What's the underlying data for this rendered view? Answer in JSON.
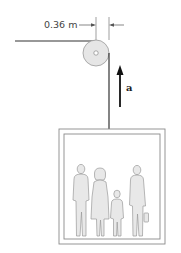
{
  "diagram": {
    "type": "physics-figure",
    "labels": {
      "pulley_radius": "0.36 m",
      "acceleration": "a"
    },
    "components": [
      {
        "name": "support-cable",
        "desc": "horizontal cable leading to pulley"
      },
      {
        "name": "pulley",
        "desc": "disk with center axle",
        "radius_label": "0.36 m"
      },
      {
        "name": "elevator-cable",
        "desc": "vertical cable from pulley to elevator"
      },
      {
        "name": "acceleration-arrow",
        "direction": "up",
        "label": "a"
      },
      {
        "name": "elevator-cab",
        "desc": "box containing four passengers"
      }
    ],
    "passengers": [
      "man",
      "woman",
      "child",
      "person-with-briefcase"
    ],
    "colors": {
      "line": "#333333",
      "pulley_fill": "#e6e6e6",
      "figure_fill": "#e8e8e8",
      "figure_stroke": "#9a9a9a",
      "box_stroke": "#8a8a8a"
    }
  }
}
